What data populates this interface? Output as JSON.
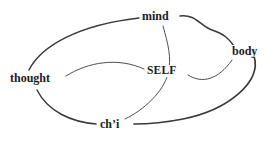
{
  "diagram": {
    "title": "",
    "background_color": "#ffffff",
    "line_color": "#3a3a3a",
    "text_color": "#1c1c1c",
    "nodes": [
      {
        "id": "mind",
        "label": "mind",
        "x": 158,
        "y": 16
      },
      {
        "id": "body",
        "label": "body",
        "x": 246,
        "y": 51
      },
      {
        "id": "thought",
        "label": "thought",
        "x": 38,
        "y": 78
      },
      {
        "id": "self",
        "label": "SELF",
        "x": 168,
        "y": 71
      },
      {
        "id": "chi",
        "label": "ch’i",
        "x": 113,
        "y": 124
      }
    ],
    "edges": [
      {
        "from": "thought",
        "to": "mind",
        "style": "curved",
        "weight": "heavy"
      },
      {
        "from": "mind",
        "to": "body",
        "style": "curved-s",
        "weight": "heavy"
      },
      {
        "from": "body",
        "to": "chi",
        "style": "curved",
        "weight": "heavy"
      },
      {
        "from": "chi",
        "to": "thought",
        "style": "curved",
        "weight": "heavy"
      },
      {
        "from": "thought",
        "to": "self",
        "style": "curved",
        "weight": "light"
      },
      {
        "from": "self",
        "to": "body",
        "style": "curved",
        "weight": "light"
      },
      {
        "from": "mind",
        "to": "chi",
        "style": "curved",
        "weight": "light"
      }
    ]
  }
}
